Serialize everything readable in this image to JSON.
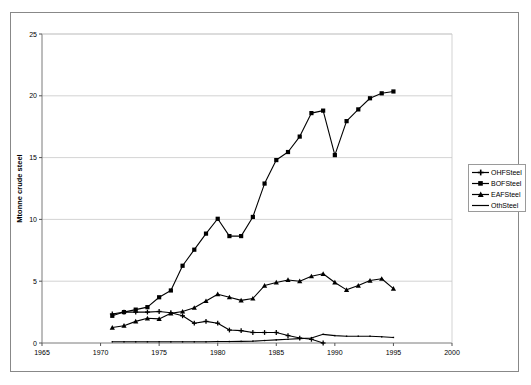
{
  "chart_data": {
    "type": "line",
    "title": "",
    "subtitle": "",
    "xlabel": "",
    "ylabel": "Mtonne crude steel",
    "xlim": [
      1965,
      2000
    ],
    "ylim": [
      0,
      25
    ],
    "xticks": [
      1965,
      1970,
      1975,
      1980,
      1985,
      1990,
      1995,
      2000
    ],
    "yticks": [
      0,
      5,
      10,
      15,
      20,
      25
    ],
    "grid": "horizontal",
    "legend_position": "right",
    "series": [
      {
        "name": "OHFSteel",
        "marker": "plus",
        "color": "#000000",
        "x": [
          1971,
          1972,
          1973,
          1974,
          1975,
          1976,
          1977,
          1978,
          1979,
          1980,
          1981,
          1982,
          1983,
          1984,
          1985,
          1986,
          1987,
          1988,
          1989
        ],
        "values": [
          2.35,
          2.5,
          2.5,
          2.5,
          2.55,
          2.45,
          2.2,
          1.6,
          1.75,
          1.6,
          1.05,
          1.0,
          0.85,
          0.85,
          0.85,
          0.6,
          0.4,
          0.3,
          0.0
        ]
      },
      {
        "name": "BOFSteel",
        "marker": "square",
        "color": "#000000",
        "x": [
          1971,
          1972,
          1973,
          1974,
          1975,
          1976,
          1977,
          1978,
          1979,
          1980,
          1981,
          1982,
          1983,
          1984,
          1985,
          1986,
          1987,
          1988,
          1989,
          1990,
          1991,
          1992,
          1993,
          1994,
          1995
        ],
        "values": [
          2.2,
          2.5,
          2.7,
          2.9,
          3.7,
          4.25,
          6.25,
          7.55,
          8.85,
          10.05,
          8.65,
          8.65,
          10.2,
          12.9,
          14.8,
          15.45,
          16.7,
          18.6,
          18.8,
          15.2,
          17.95,
          18.9,
          19.8,
          20.2,
          20.35
        ]
      },
      {
        "name": "EAFSteel",
        "marker": "triangle",
        "color": "#000000",
        "x": [
          1971,
          1972,
          1973,
          1974,
          1975,
          1976,
          1977,
          1978,
          1979,
          1980,
          1981,
          1982,
          1983,
          1984,
          1985,
          1986,
          1987,
          1988,
          1989,
          1990,
          1991,
          1992,
          1993,
          1994,
          1995
        ],
        "values": [
          1.25,
          1.4,
          1.75,
          2.0,
          1.95,
          2.4,
          2.55,
          2.85,
          3.4,
          3.95,
          3.7,
          3.45,
          3.6,
          4.65,
          4.9,
          5.1,
          5.0,
          5.4,
          5.6,
          4.9,
          4.3,
          4.65,
          5.05,
          5.2,
          4.4
        ]
      },
      {
        "name": "OthSteel",
        "marker": "line",
        "color": "#000000",
        "x": [
          1971,
          1972,
          1973,
          1974,
          1975,
          1976,
          1977,
          1978,
          1979,
          1980,
          1981,
          1982,
          1983,
          1984,
          1985,
          1986,
          1987,
          1988,
          1989,
          1990,
          1991,
          1992,
          1993,
          1994,
          1995
        ],
        "values": [
          0.1,
          0.1,
          0.1,
          0.1,
          0.1,
          0.1,
          0.1,
          0.1,
          0.1,
          0.12,
          0.12,
          0.13,
          0.15,
          0.2,
          0.25,
          0.3,
          0.35,
          0.4,
          0.7,
          0.6,
          0.55,
          0.55,
          0.55,
          0.5,
          0.45
        ]
      }
    ]
  },
  "legend": {
    "items": [
      {
        "label": "OHFSteel"
      },
      {
        "label": "BOFSteel"
      },
      {
        "label": "EAFSteel"
      },
      {
        "label": "OthSteel"
      }
    ]
  },
  "axes": {
    "ylabel": "Mtonne crude steel",
    "xticklabels": [
      "1965",
      "1970",
      "1975",
      "1980",
      "1985",
      "1990",
      "1995",
      "2000"
    ],
    "yticklabels": [
      "0",
      "5",
      "10",
      "15",
      "20",
      "25"
    ]
  },
  "colors": {
    "ink": "#000000",
    "grid": "#c8c8c8",
    "frame": "#888888",
    "background": "#ffffff"
  }
}
